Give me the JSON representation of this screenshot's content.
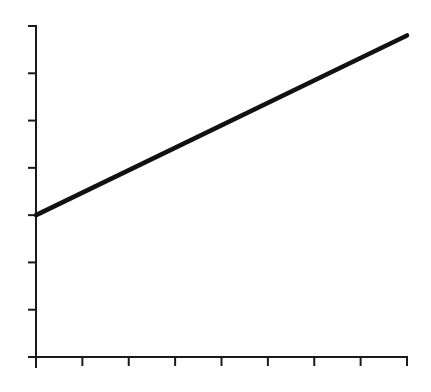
{
  "chart_data": {
    "type": "line",
    "title": "",
    "xlabel": "",
    "ylabel": "",
    "x_ticks": [
      0,
      1,
      2,
      3,
      4,
      5,
      6,
      7,
      8
    ],
    "y_ticks": [
      0,
      1,
      2,
      3,
      4,
      5,
      6,
      7
    ],
    "tick_labels_visible": false,
    "xlim": [
      0,
      8
    ],
    "ylim": [
      0,
      7
    ],
    "grid": false,
    "legend": null,
    "series": [
      {
        "name": "line",
        "x": [
          0,
          8
        ],
        "values": [
          3,
          6.8
        ],
        "color": "#111111"
      }
    ]
  }
}
